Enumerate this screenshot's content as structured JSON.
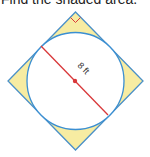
{
  "prompt": "Find the shaded area.",
  "figure": {
    "diameter_label": "8 ft",
    "colors": {
      "shade": "#f7eca2",
      "circle_stroke": "#3b8fd2",
      "square_stroke": "#4a90c8",
      "diameter": "#d9383a",
      "right_angle_mark": "#d9383a",
      "center_dot": "#d9383a"
    }
  }
}
